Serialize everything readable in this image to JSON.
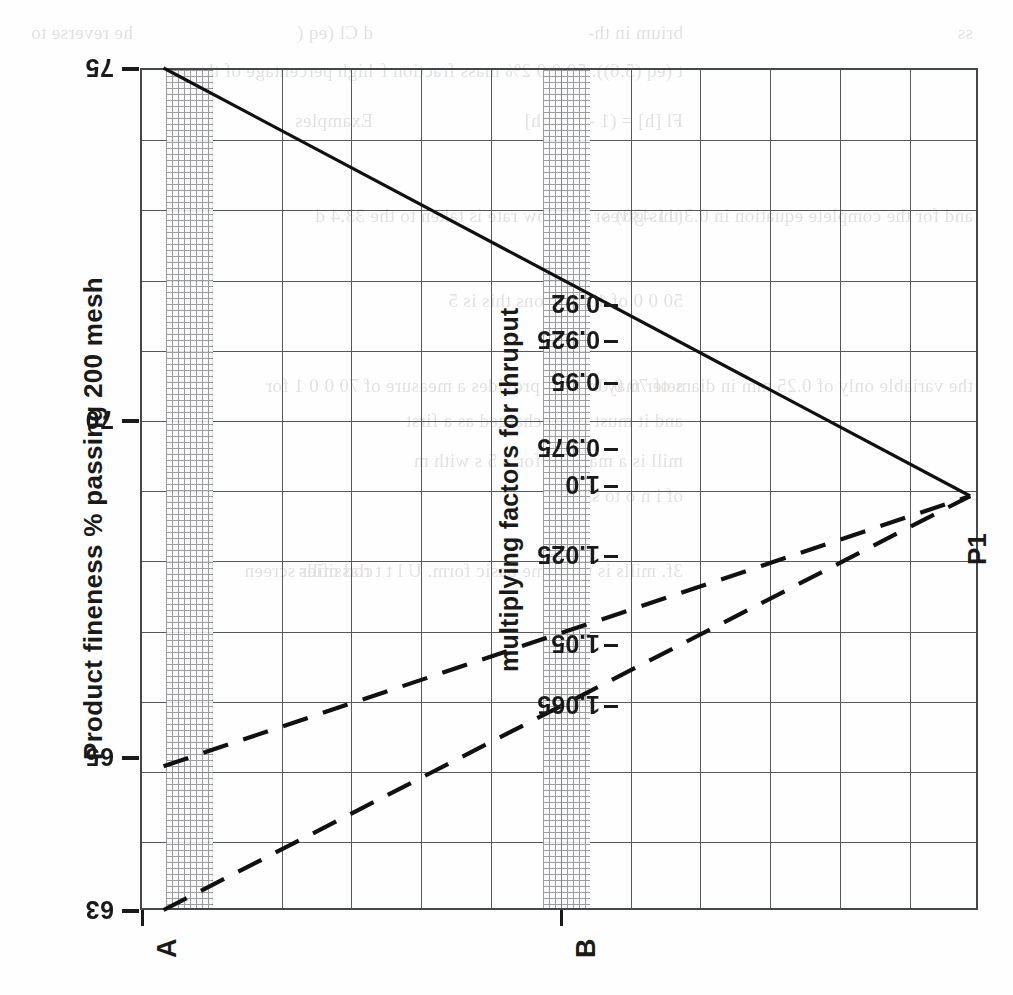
{
  "page": {
    "orientation": "rotated-90",
    "background": "#fefefe",
    "ink": "#1a1a1a"
  },
  "axis": {
    "y_title": "Product fineness  % passing 200 mesh",
    "factor_title": "multiplying factors for thruput",
    "y_ticks": [
      "75",
      "70",
      "65",
      "63"
    ],
    "factor_ticks": [
      "0.92",
      "0.925",
      "0.95",
      "0.975",
      "1.0",
      "1.025",
      "1.05",
      "1.065"
    ]
  },
  "markers": {
    "a_label": "A",
    "b_label": "B",
    "p1_label": "P1"
  },
  "ghost_text": {
    "lines": [
      "ss",
      "brium in th-",
      "d Cl (eq (",
      "he reverse to",
      "t (eq (5.6)). 50 0 0 2% mass fraction f",
      "high percentage of the ca",
      "Fl  [h] = (1 -  [h])  [h]",
      "Examples",
      "and for the complete equation in 0.3 this gives",
      "(11.430) or the flow rate is taken to the 33.4 d",
      "50 0 0 of 1 0 - 0 tons this is 5",
      "the variable only of 0.25 mm in diameter may be",
      "s of 70 0 0 which provides a measure of 70 0 0 1 for",
      "and it must be discharged as a first",
      "mill is a machine for 3 5 s with m",
      "of i  n o  to sizes",
      "3f. mills is the same basic form. U  l  t  t  rod mills",
      "classifier screen"
    ]
  },
  "chart_data": {
    "type": "line",
    "title": "",
    "xlabel": "multiplying factors for thruput",
    "ylabel": "Product fineness  % passing 200 mesh",
    "ylim": [
      63,
      75
    ],
    "xlim": [
      0.915,
      1.075
    ],
    "grid": true,
    "legend": "none",
    "annotations": [
      {
        "text": "A",
        "x": 0.92,
        "note": "hatched band at left edge of plot"
      },
      {
        "text": "B",
        "x": 0.9925,
        "note": "hatched band near mid plot"
      },
      {
        "text": "P1",
        "x": 1.0735,
        "y": 68.9,
        "note": "convergence point of the three curves"
      }
    ],
    "bands": [
      {
        "name": "A",
        "x_start": 0.9195,
        "x_end": 0.9285,
        "style": "cross-hatched"
      },
      {
        "name": "B",
        "x_start": 0.9915,
        "x_end": 1.0005,
        "style": "cross-hatched"
      }
    ],
    "series": [
      {
        "name": "upper solid curve",
        "style": "solid",
        "points": [
          {
            "x": 0.9195,
            "y": 75.0
          },
          {
            "x": 1.0735,
            "y": 68.9
          }
        ]
      },
      {
        "name": "middle dashed curve",
        "style": "dashed",
        "points": [
          {
            "x": 0.9195,
            "y": 65.05
          },
          {
            "x": 1.0735,
            "y": 68.9
          }
        ]
      },
      {
        "name": "lower dashed curve",
        "style": "dashed",
        "points": [
          {
            "x": 0.9195,
            "y": 63.0
          },
          {
            "x": 1.0735,
            "y": 68.9
          }
        ]
      }
    ]
  }
}
